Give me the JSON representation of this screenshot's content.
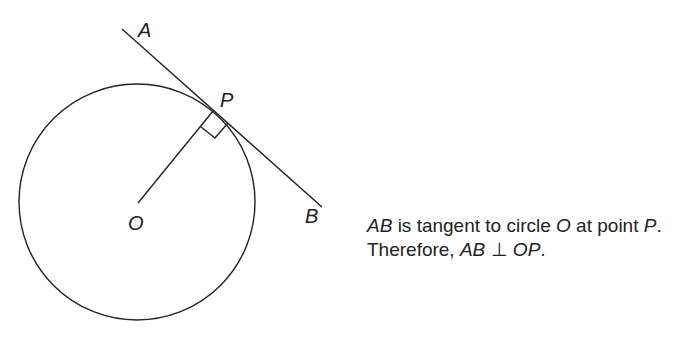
{
  "diagram": {
    "type": "geometry-tangent",
    "circle": {
      "center_label": "O",
      "cx": 137,
      "cy": 202,
      "r": 118
    },
    "points": {
      "A": {
        "label": "A",
        "x": 122,
        "y": 29,
        "label_x": 138,
        "label_y": 37
      },
      "B": {
        "label": "B",
        "x": 322,
        "y": 207,
        "label_x": 305,
        "label_y": 223
      },
      "P": {
        "label": "P",
        "x": 213,
        "y": 110,
        "label_x": 220,
        "label_y": 106
      },
      "O": {
        "label": "O",
        "x": 138,
        "y": 203,
        "label_x": 128,
        "label_y": 230
      }
    },
    "stroke_color": "#222222"
  },
  "caption": {
    "line1": {
      "t1": "AB",
      "t2": " is tangent to circle ",
      "t3": "O",
      "t4": " at point ",
      "t5": "P",
      "t6": "."
    },
    "line2": {
      "t1": "Therefore, ",
      "t2": "AB",
      "t3": " ⊥ ",
      "t4": "OP",
      "t5": "."
    }
  }
}
